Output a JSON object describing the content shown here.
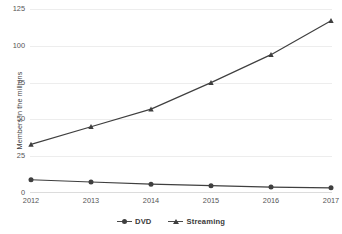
{
  "chart_data": {
    "type": "line",
    "title": "",
    "xlabel": "",
    "ylabel": "Members in the millions",
    "categories": [
      "2012",
      "2013",
      "2014",
      "2015",
      "2016",
      "2017"
    ],
    "ylim": [
      0,
      125
    ],
    "yticks": [
      "0",
      "25",
      "50",
      "75",
      "100",
      "125"
    ],
    "ytick_values": [
      0,
      25,
      50,
      75,
      100,
      125
    ],
    "grid": true,
    "legend_position": "bottom",
    "series": [
      {
        "name": "DVD",
        "marker": "circle",
        "color": "#3f3f3f",
        "values": [
          9,
          7.5,
          6,
          5,
          4,
          3.5
        ]
      },
      {
        "name": "Streaming",
        "marker": "triangle",
        "color": "#3f3f3f",
        "values": [
          33,
          45,
          57,
          75,
          94,
          117
        ]
      }
    ]
  },
  "legend": {
    "items": [
      {
        "label": "DVD",
        "marker": "circle-marker-icon"
      },
      {
        "label": "Streaming",
        "marker": "triangle-marker-icon"
      }
    ]
  }
}
